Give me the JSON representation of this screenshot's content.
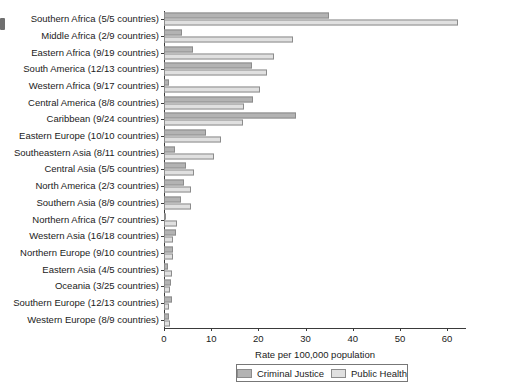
{
  "chart_data": {
    "type": "bar",
    "orientation": "horizontal",
    "title": "",
    "xlabel": "Rate per 100,000 population",
    "ylabel": "",
    "xlim": [
      0,
      64
    ],
    "xticks": [
      0,
      10,
      20,
      30,
      40,
      50,
      60
    ],
    "grid": false,
    "legend_position": "bottom",
    "categories": [
      "Southern Africa (5/5 countries)",
      "Middle Africa (2/9 countries)",
      "Eastern Africa (9/19 countries)",
      "South America (12/13 countries)",
      "Western Africa (9/17 countries)",
      "Central America (8/8 countries)",
      "Caribbean (9/24 countries)",
      "Eastern Europe (10/10 countries)",
      "Southeastern Asia (8/11 countries)",
      "Central Asia (5/5 countries)",
      "North America (2/3 countries)",
      "Southern Asia (8/9 countries)",
      "Northern Africa (5/7 countries)",
      "Western Asia (16/18 countries)",
      "Northern Europe (9/10 countries)",
      "Eastern Asia (4/5 countries)",
      "Oceania (3/25 countries)",
      "Southern Europe (12/13 countries)",
      "Western Europe (8/9 countries)"
    ],
    "series": [
      {
        "name": "Criminal Justice",
        "color": "#b3b3b3",
        "values": [
          35.0,
          3.8,
          6.2,
          18.7,
          1.0,
          18.9,
          28.0,
          8.9,
          2.4,
          4.6,
          4.2,
          3.6,
          0.3,
          2.6,
          2.0,
          0.8,
          1.4,
          1.6,
          1.0
        ]
      },
      {
        "name": "Public Health",
        "color": "#e0e0e0",
        "values": [
          62.2,
          27.4,
          23.3,
          21.9,
          20.3,
          16.9,
          16.7,
          12.1,
          10.7,
          6.4,
          5.8,
          5.8,
          2.8,
          2.0,
          2.0,
          1.8,
          1.2,
          1.1,
          1.2
        ]
      }
    ]
  },
  "legend": {
    "items": [
      {
        "label": "Criminal Justice",
        "key": "cj"
      },
      {
        "label": "Public Health",
        "key": "ph"
      }
    ]
  }
}
